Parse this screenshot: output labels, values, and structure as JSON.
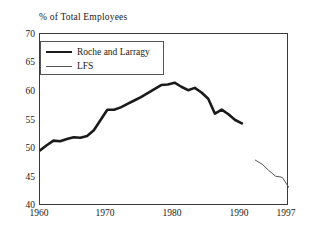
{
  "chart_data": {
    "type": "line",
    "title": "",
    "xlabel": "",
    "ylabel": "% of Total Employees",
    "xlim": [
      1960,
      1997
    ],
    "ylim": [
      40,
      70
    ],
    "grid": false,
    "legend_position": "top-left",
    "yticks": [
      "70",
      "65",
      "60",
      "55",
      "50",
      "45",
      "40"
    ],
    "ytick_values": [
      70,
      65,
      60,
      55,
      50,
      45,
      40
    ],
    "xticks": [
      "1960",
      "1970",
      "1980",
      "1990",
      "1997"
    ],
    "xtick_values": [
      1960,
      1970,
      1980,
      1990,
      1997
    ],
    "series": [
      {
        "name": "Roche and Larragy",
        "style": "thick",
        "color": "#1a1a1a",
        "x": [
          1960,
          1961,
          1962,
          1963,
          1964,
          1965,
          1966,
          1967,
          1968,
          1969,
          1970,
          1971,
          1972,
          1973,
          1974,
          1975,
          1976,
          1977,
          1978,
          1979,
          1980,
          1981,
          1982,
          1983,
          1984,
          1985,
          1986,
          1987,
          1988,
          1989,
          1990
        ],
        "values": [
          49.7,
          50.6,
          51.4,
          51.3,
          51.7,
          52.0,
          51.9,
          52.2,
          53.2,
          55.0,
          56.8,
          56.8,
          57.2,
          57.8,
          58.4,
          59.0,
          59.7,
          60.4,
          61.1,
          61.2,
          61.5,
          60.8,
          60.2,
          60.6,
          59.8,
          58.7,
          56.1,
          56.8,
          56.0,
          55.0,
          54.4
        ]
      },
      {
        "name": "LFS",
        "style": "thin",
        "color": "#555555",
        "x": [
          1992,
          1993,
          1994,
          1995,
          1996,
          1997
        ],
        "values": [
          48.0,
          47.3,
          46.2,
          45.2,
          45.0,
          43.2
        ]
      }
    ]
  }
}
